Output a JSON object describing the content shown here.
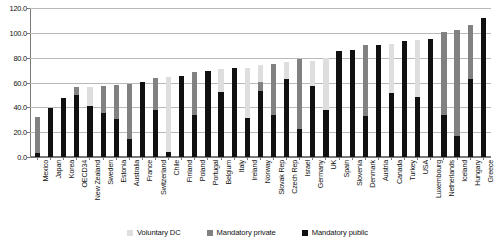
{
  "chart_data": {
    "type": "bar",
    "stacked": true,
    "title": "",
    "subtitle": "",
    "xlabel": "",
    "ylabel": "",
    "ylim": [
      0.0,
      120.0
    ],
    "yticks": [
      "0.0",
      "20.0",
      "40.0",
      "60.0",
      "80.0",
      "100.0",
      "120.0"
    ],
    "ytick_values": [
      0.0,
      20.0,
      40.0,
      60.0,
      80.0,
      100.0,
      120.0
    ],
    "grid": "horizontal",
    "legend_position": "bottom",
    "categories": [
      "Mexico",
      "Japan",
      "Korea",
      "OECD34",
      "New Zealand",
      "Sweden",
      "Estonia",
      "Australia",
      "France",
      "Switzerland",
      "Chile",
      "Finland",
      "Poland",
      "Portugal",
      "Belgium",
      "Italy",
      "Ireland",
      "Norway",
      "Slovak Rep",
      "Czech Rep",
      "Israel",
      "Germany",
      "UK",
      "Spain",
      "Slovenia",
      "Denmark",
      "Austria",
      "Canada",
      "Turkey",
      "USA",
      "Luxembourg",
      "Netherlands",
      "Iceland",
      "Hungary",
      "Greece"
    ],
    "series": [
      {
        "name": "Mandatory public",
        "color": "#111111",
        "values": [
          3.2,
          39.8,
          47.3,
          50.1,
          41.2,
          35.5,
          30.8,
          14.8,
          60.3,
          38.0,
          4.3,
          65.1,
          33.6,
          69.2,
          52.5,
          72.0,
          31.8,
          53.2,
          33.6,
          63.0,
          22.5,
          56.8,
          38.2,
          85.5,
          85.9,
          32.9,
          90.4,
          51.2,
          93.6,
          48.0,
          94.9,
          33.8,
          16.6,
          62.8,
          111.9
        ]
      },
      {
        "name": "Mandatory private",
        "color": "#818181",
        "values": [
          29.2,
          0.0,
          0.0,
          5.9,
          0.0,
          22.0,
          27.5,
          44.0,
          0.0,
          25.8,
          0.0,
          0.0,
          34.5,
          0.0,
          0.0,
          0.0,
          0.0,
          7.4,
          41.0,
          0.0,
          56.2,
          0.0,
          0.0,
          0.0,
          0.0,
          57.3,
          0.0,
          0.0,
          0.0,
          0.0,
          0.0,
          66.6,
          85.4,
          43.9,
          0.0
        ]
      },
      {
        "name": "Voluntary DC",
        "color": "#dedede",
        "values": [
          0.0,
          0.0,
          0.0,
          0.0,
          15.3,
          0.0,
          0.0,
          0.0,
          0.0,
          0.0,
          60.3,
          0.0,
          0.0,
          0.0,
          18.4,
          0.0,
          40.0,
          13.2,
          0.0,
          13.6,
          0.0,
          20.9,
          41.7,
          0.0,
          0.0,
          0.0,
          0.0,
          39.6,
          0.0,
          46.4,
          0.0,
          0.0,
          0.0,
          0.0,
          0.0
        ]
      }
    ],
    "legend": [
      {
        "label": "Voluntary DC",
        "color": "#dedede"
      },
      {
        "label": "Mandatory private",
        "color": "#818181"
      },
      {
        "label": "Mandatory public",
        "color": "#111111"
      }
    ]
  }
}
